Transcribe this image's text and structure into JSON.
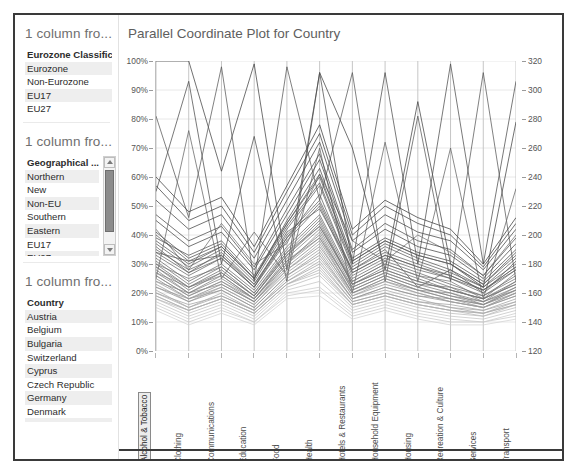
{
  "widget": {
    "frame_color": "#3a3a3a"
  },
  "filters": [
    {
      "title": "1 column fro...",
      "field": "Eurozone Classificatio",
      "scrollable": false,
      "items": [
        "Eurozone",
        "Non-Eurozone",
        "EU17",
        "EU27"
      ]
    },
    {
      "title": "1 column fro...",
      "field": "Geographical ...",
      "scrollable": true,
      "scroll_up_icon": "triangle-up-icon",
      "scroll_down_icon": "triangle-down-icon",
      "items": [
        "Northern",
        "New",
        "Non-EU",
        "Southern",
        "Eastern",
        "EU17",
        "EU27"
      ]
    },
    {
      "title": "1 column fro...",
      "field": "Country",
      "scrollable": false,
      "items": [
        "Austria",
        "Belgium",
        "Bulgaria",
        "Switzerland",
        "Cyprus",
        "Czech Republic",
        "Germany",
        "Denmark",
        "EU27"
      ]
    }
  ],
  "chart_data": {
    "type": "line",
    "title": "Parallel Coordinate Plot for Country",
    "xlabel": "",
    "ylabel": "",
    "grid": true,
    "legend_position": "none",
    "categories": [
      "Alcohol & Tobacco",
      "Clothing",
      "Communications",
      "Education",
      "Food",
      "Health",
      "Hotels & Restaurants",
      "Household Equipment",
      "Housing",
      "Recreation & Culture",
      "Services",
      "Transport"
    ],
    "selected_category": "Alcohol & Tobacco",
    "left_axis": {
      "ticks": [
        "0%",
        "10%",
        "20%",
        "30%",
        "40%",
        "50%",
        "60%",
        "70%",
        "80%",
        "90%",
        "100%"
      ],
      "values": [
        0,
        10,
        20,
        30,
        40,
        50,
        60,
        70,
        80,
        90,
        100
      ],
      "ylim": [
        0,
        100
      ]
    },
    "right_axis": {
      "ticks": [
        "120",
        "140",
        "160",
        "180",
        "200",
        "220",
        "240",
        "260",
        "280",
        "300",
        "320"
      ],
      "values": [
        120,
        140,
        160,
        180,
        200,
        220,
        240,
        260,
        280,
        300,
        320
      ],
      "ylim": [
        120,
        320
      ]
    },
    "series": [
      {
        "name": "Austria",
        "color": "#444444",
        "values": [
          100,
          100,
          62,
          99,
          28,
          96,
          70,
          28,
          86,
          30,
          22,
          79
        ]
      },
      {
        "name": "Belgium",
        "color": "#4f4f4f",
        "values": [
          55,
          93,
          30,
          74,
          24,
          96,
          30,
          96,
          30,
          99,
          30,
          93
        ]
      },
      {
        "name": "Bulgaria",
        "color": "#5a5a5a",
        "values": [
          81,
          46,
          98,
          24,
          98,
          52,
          96,
          24,
          81,
          24,
          96,
          24
        ]
      },
      {
        "name": "Switzerland",
        "color": "#666666",
        "values": [
          25,
          76,
          25,
          41,
          26,
          70,
          20,
          72,
          24,
          70,
          18,
          56
        ]
      },
      {
        "name": "Cyprus",
        "color": "#707070",
        "values": [
          42,
          28,
          44,
          30,
          37,
          61,
          38,
          31,
          40,
          34,
          26,
          40
        ]
      },
      {
        "name": "Czech Republic",
        "color": "#5c5c5c",
        "values": [
          34,
          31,
          33,
          22,
          41,
          49,
          28,
          35,
          22,
          28,
          20,
          31
        ]
      },
      {
        "name": "Germany",
        "color": "#7a7a7a",
        "values": [
          30,
          25,
          29,
          20,
          34,
          43,
          24,
          30,
          26,
          24,
          18,
          27
        ]
      },
      {
        "name": "Denmark",
        "color": "#848484",
        "values": [
          27,
          22,
          26,
          18,
          31,
          39,
          22,
          27,
          23,
          22,
          17,
          24
        ]
      },
      {
        "name": "Estonia",
        "color": "#8e8e8e",
        "values": [
          24,
          20,
          23,
          17,
          28,
          36,
          20,
          24,
          21,
          20,
          16,
          22
        ]
      },
      {
        "name": "Greece",
        "color": "#989898",
        "values": [
          22,
          18,
          21,
          15,
          26,
          33,
          18,
          22,
          19,
          18,
          15,
          20
        ]
      },
      {
        "name": "Spain",
        "color": "#616161",
        "values": [
          36,
          27,
          34,
          23,
          39,
          54,
          27,
          33,
          29,
          26,
          21,
          29
        ]
      },
      {
        "name": "Finland",
        "color": "#a2a2a2",
        "values": [
          20,
          16,
          19,
          14,
          24,
          30,
          17,
          20,
          17,
          16,
          14,
          18
        ]
      },
      {
        "name": "France",
        "color": "#555555",
        "values": [
          39,
          33,
          38,
          26,
          44,
          60,
          31,
          38,
          33,
          30,
          23,
          34
        ]
      },
      {
        "name": "Croatia",
        "color": "#6b6b6b",
        "values": [
          32,
          24,
          30,
          21,
          36,
          47,
          25,
          31,
          27,
          23,
          19,
          26
        ]
      },
      {
        "name": "Hungary",
        "color": "#757575",
        "values": [
          29,
          21,
          27,
          19,
          33,
          44,
          23,
          28,
          24,
          21,
          18,
          23
        ]
      },
      {
        "name": "Ireland",
        "color": "#4a4a4a",
        "values": [
          45,
          36,
          41,
          28,
          47,
          66,
          34,
          42,
          36,
          33,
          25,
          37
        ]
      },
      {
        "name": "Iceland",
        "color": "#8a8a8a",
        "values": [
          26,
          19,
          24,
          17,
          30,
          41,
          21,
          26,
          22,
          19,
          16,
          21
        ]
      },
      {
        "name": "Italy",
        "color": "#5f5f5f",
        "values": [
          37,
          29,
          35,
          24,
          42,
          57,
          29,
          36,
          31,
          27,
          22,
          30
        ]
      },
      {
        "name": "Lithuania",
        "color": "#9c9c9c",
        "values": [
          23,
          17,
          22,
          16,
          27,
          35,
          19,
          23,
          20,
          17,
          15,
          19
        ]
      },
      {
        "name": "Luxembourg",
        "color": "#696969",
        "values": [
          33,
          26,
          32,
          22,
          38,
          50,
          26,
          32,
          28,
          25,
          20,
          28
        ]
      },
      {
        "name": "Latvia",
        "color": "#a8a8a8",
        "values": [
          21,
          15,
          20,
          14,
          25,
          32,
          18,
          21,
          18,
          15,
          14,
          17
        ]
      },
      {
        "name": "Montenegro",
        "color": "#7e7e7e",
        "values": [
          28,
          20,
          26,
          18,
          32,
          42,
          22,
          27,
          23,
          20,
          17,
          22
        ]
      },
      {
        "name": "Macedonia",
        "color": "#b2b2b2",
        "values": [
          19,
          14,
          18,
          13,
          23,
          28,
          16,
          19,
          16,
          14,
          13,
          16
        ]
      },
      {
        "name": "Malta",
        "color": "#525252",
        "values": [
          41,
          32,
          37,
          25,
          45,
          63,
          32,
          39,
          34,
          31,
          24,
          35
        ]
      },
      {
        "name": "Netherlands",
        "color": "#727272",
        "values": [
          31,
          23,
          29,
          20,
          35,
          46,
          24,
          30,
          26,
          22,
          19,
          25
        ]
      },
      {
        "name": "Norway",
        "color": "#bcbcbc",
        "values": [
          18,
          13,
          17,
          12,
          22,
          26,
          15,
          18,
          15,
          13,
          12,
          15
        ]
      },
      {
        "name": "Poland",
        "color": "#646464",
        "values": [
          35,
          28,
          33,
          23,
          40,
          52,
          28,
          34,
          30,
          26,
          21,
          29
        ]
      },
      {
        "name": "Portugal",
        "color": "#888888",
        "values": [
          25,
          18,
          23,
          17,
          29,
          38,
          20,
          25,
          21,
          18,
          16,
          20
        ]
      },
      {
        "name": "Romania",
        "color": "#585858",
        "values": [
          38,
          30,
          36,
          25,
          43,
          58,
          30,
          37,
          32,
          28,
          22,
          32
        ]
      },
      {
        "name": "Serbia",
        "color": "#c4c4c4",
        "values": [
          17,
          12,
          16,
          11,
          21,
          24,
          14,
          17,
          14,
          12,
          11,
          14
        ]
      },
      {
        "name": "Sweden",
        "color": "#949494",
        "values": [
          22,
          17,
          21,
          15,
          26,
          34,
          18,
          22,
          19,
          17,
          15,
          19
        ]
      },
      {
        "name": "Slovenia",
        "color": "#6e6e6e",
        "values": [
          30,
          22,
          28,
          19,
          34,
          45,
          23,
          29,
          25,
          21,
          18,
          24
        ]
      },
      {
        "name": "Slovakia",
        "color": "#a5a5a5",
        "values": [
          20,
          15,
          19,
          14,
          24,
          31,
          17,
          20,
          17,
          15,
          13,
          17
        ]
      },
      {
        "name": "Turkey",
        "color": "#4d4d4d",
        "values": [
          47,
          38,
          43,
          29,
          49,
          68,
          35,
          44,
          38,
          35,
          26,
          39
        ]
      },
      {
        "name": "United Kingdom",
        "color": "#808080",
        "values": [
          27,
          20,
          25,
          18,
          31,
          40,
          21,
          26,
          22,
          19,
          17,
          21
        ]
      },
      {
        "name": "EU17",
        "color": "#cccccc",
        "values": [
          16,
          11,
          15,
          10,
          20,
          22,
          13,
          16,
          13,
          11,
          10,
          13
        ]
      },
      {
        "name": "EU27",
        "color": "#b8b8b8",
        "values": [
          18,
          14,
          18,
          13,
          23,
          27,
          16,
          19,
          16,
          14,
          12,
          16
        ]
      },
      {
        "name": "Denmark2",
        "color": "#3f3f3f",
        "values": [
          60,
          48,
          53,
          36,
          57,
          78,
          42,
          52,
          46,
          42,
          30,
          46
        ]
      },
      {
        "name": "Norway2",
        "color": "#474747",
        "values": [
          52,
          42,
          47,
          32,
          52,
          72,
          38,
          47,
          41,
          38,
          28,
          42
        ]
      },
      {
        "name": "Iceland2",
        "color": "#9f9f9f",
        "values": [
          24,
          18,
          22,
          16,
          28,
          37,
          19,
          24,
          20,
          17,
          15,
          20
        ]
      },
      {
        "name": "Ireland2",
        "color": "#d4d4d4",
        "values": [
          14,
          9,
          13,
          9,
          18,
          19,
          11,
          14,
          11,
          9,
          9,
          11
        ]
      },
      {
        "name": "Spain2",
        "color": "#434343",
        "values": [
          57,
          45,
          50,
          34,
          55,
          75,
          40,
          50,
          44,
          40,
          29,
          44
        ]
      },
      {
        "name": "Italy2",
        "color": "#8c8c8c",
        "values": [
          26,
          19,
          24,
          18,
          30,
          39,
          20,
          25,
          21,
          18,
          16,
          21
        ]
      },
      {
        "name": "Greece2",
        "color": "#c9c9c9",
        "values": [
          15,
          10,
          14,
          10,
          19,
          21,
          12,
          15,
          12,
          10,
          10,
          12
        ]
      },
      {
        "name": "Malta2",
        "color": "#767676",
        "values": [
          29,
          22,
          27,
          19,
          33,
          43,
          23,
          28,
          24,
          21,
          18,
          23
        ]
      },
      {
        "name": "Cyprus2",
        "color": "#5b5b5b",
        "values": [
          40,
          31,
          36,
          25,
          44,
          61,
          31,
          38,
          33,
          30,
          23,
          33
        ]
      },
      {
        "name": "Latvia2",
        "color": "#aeaeae",
        "values": [
          19,
          14,
          18,
          13,
          23,
          29,
          16,
          19,
          16,
          14,
          13,
          16
        ]
      },
      {
        "name": "Poland2",
        "color": "#636363",
        "values": [
          34,
          27,
          32,
          22,
          39,
          51,
          27,
          33,
          29,
          25,
          21,
          28
        ]
      }
    ]
  }
}
